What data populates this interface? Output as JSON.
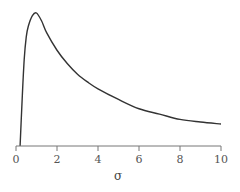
{
  "chart_data": {
    "type": "line",
    "title": "",
    "xlabel": "σ",
    "ylabel": "",
    "xlim": [
      0,
      10
    ],
    "ylim": [
      0,
      1
    ],
    "grid": false,
    "legend": null,
    "x_ticks": [
      "0",
      "2",
      "4",
      "6",
      "8",
      "10"
    ],
    "y_ticks": [],
    "series": [
      {
        "name": "density",
        "color": "#333333",
        "x": [
          0.2,
          0.3,
          0.4,
          0.5,
          0.6,
          0.8,
          1.0,
          1.25,
          1.5,
          2,
          2.5,
          3,
          3.5,
          4,
          5,
          6,
          7,
          8,
          9,
          10
        ],
        "y": [
          0.0,
          0.35,
          0.65,
          0.82,
          0.9,
          0.98,
          1.0,
          0.94,
          0.85,
          0.72,
          0.62,
          0.54,
          0.48,
          0.43,
          0.35,
          0.28,
          0.24,
          0.2,
          0.18,
          0.165
        ]
      }
    ]
  },
  "axis": {
    "x_label": "σ",
    "ticks": [
      "0",
      "2",
      "4",
      "6",
      "8",
      "10"
    ]
  }
}
